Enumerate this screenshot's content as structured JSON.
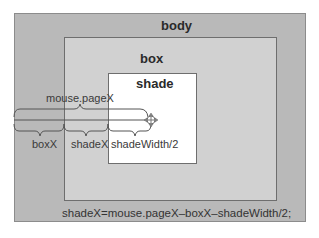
{
  "regions": {
    "body": {
      "label": "body"
    },
    "box": {
      "label": "box"
    },
    "shade": {
      "label": "shade"
    }
  },
  "measurements": {
    "mouse_pagex": "mouse.pageX",
    "boxx": "boxX",
    "shadex": "shadeX",
    "shade_half_width": "shadeWidth/2"
  },
  "cursor": {
    "icon": "move-cursor-icon"
  },
  "formula": "shadeX=mouse.pageX–boxX–shadeWidth/2;",
  "colors": {
    "body_fill": "#b9b9b9",
    "box_fill": "#d1d1d1",
    "shade_fill": "#ffffff",
    "line": "#555555"
  }
}
